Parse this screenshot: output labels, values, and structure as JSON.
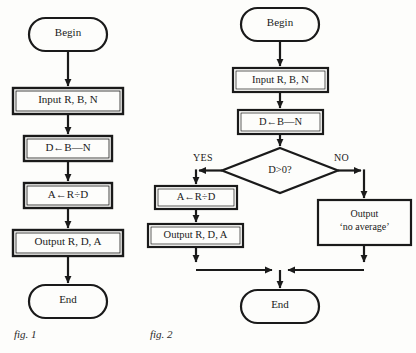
{
  "figure_set": {
    "background_color": "#fdfdfb",
    "ink_color": "#1a1a1a"
  },
  "figures": [
    {
      "caption": "fig. 1",
      "caption_x": 14,
      "caption_y": 334,
      "nodes": [
        {
          "name": "begin",
          "shape": "terminator",
          "text": "Begin",
          "x": 29,
          "y": 18,
          "w": 78,
          "h": 33,
          "font_size": 11
        },
        {
          "name": "input",
          "shape": "process",
          "text": "Input R, B, N",
          "x": 13,
          "y": 88,
          "w": 110,
          "h": 26,
          "font_size": 11
        },
        {
          "name": "compute-d",
          "shape": "process",
          "text": "D←B—N",
          "x": 24,
          "y": 136,
          "w": 88,
          "h": 25,
          "font_size": 11
        },
        {
          "name": "compute-a",
          "shape": "process",
          "text": "A←R÷D",
          "x": 24,
          "y": 183,
          "w": 88,
          "h": 25,
          "font_size": 11
        },
        {
          "name": "output",
          "shape": "process",
          "text": "Output R, D, A",
          "x": 13,
          "y": 230,
          "w": 110,
          "h": 26,
          "font_size": 11
        },
        {
          "name": "end",
          "shape": "terminator",
          "text": "End",
          "x": 29,
          "y": 285,
          "w": 78,
          "h": 33,
          "font_size": 11
        }
      ],
      "connectors": [
        {
          "name": "begin-to-input",
          "from": "begin",
          "to": "input"
        },
        {
          "name": "input-to-compute-d",
          "from": "input",
          "to": "compute-d"
        },
        {
          "name": "compute-d-to-compute-a",
          "from": "compute-d",
          "to": "compute-a"
        },
        {
          "name": "compute-a-to-output",
          "from": "compute-a",
          "to": "output"
        },
        {
          "name": "output-to-end",
          "from": "output",
          "to": "end"
        }
      ]
    },
    {
      "caption": "fig. 2",
      "caption_x": 150,
      "caption_y": 334,
      "nodes": [
        {
          "name": "begin",
          "shape": "terminator",
          "text": "Begin",
          "x": 241,
          "y": 8,
          "w": 78,
          "h": 33,
          "font_size": 11
        },
        {
          "name": "input",
          "shape": "process",
          "text": "Input R, B, N",
          "x": 233,
          "y": 68,
          "w": 95,
          "h": 24,
          "font_size": 10.5
        },
        {
          "name": "compute-d",
          "shape": "process",
          "text": "D←B—N",
          "x": 238,
          "y": 110,
          "w": 85,
          "h": 24,
          "font_size": 10.5
        },
        {
          "name": "decision",
          "shape": "decision",
          "text": "D>0?",
          "x": 222,
          "y": 148,
          "w": 116,
          "h": 45,
          "font_size": 10.5
        },
        {
          "name": "compute-a",
          "shape": "process",
          "text": "A←R÷D",
          "x": 155,
          "y": 186,
          "w": 82,
          "h": 23,
          "font_size": 10.5
        },
        {
          "name": "output-values",
          "shape": "process",
          "text": "Output R, D, A",
          "x": 148,
          "y": 224,
          "w": 95,
          "h": 23,
          "font_size": 10.5
        },
        {
          "name": "output-no-average",
          "shape": "process",
          "text": "Output\n‘no average’",
          "x": 318,
          "y": 200,
          "w": 93,
          "h": 45,
          "font_size": 10
        },
        {
          "name": "end",
          "shape": "terminator",
          "text": "End",
          "x": 241,
          "y": 290,
          "w": 78,
          "h": 33,
          "font_size": 11
        }
      ],
      "branch_labels": [
        {
          "name": "yes-label",
          "text": "YES",
          "x": 193,
          "y": 152
        },
        {
          "name": "no-label",
          "text": "NO",
          "x": 334,
          "y": 152
        }
      ],
      "connectors": [
        {
          "name": "begin-to-input",
          "from": "begin",
          "to": "input"
        },
        {
          "name": "input-to-compute-d",
          "from": "input",
          "to": "compute-d"
        },
        {
          "name": "compute-d-to-decision",
          "from": "compute-d",
          "to": "decision"
        },
        {
          "name": "decision-yes-to-compute-a",
          "from": "decision",
          "to": "compute-a",
          "label": "YES"
        },
        {
          "name": "decision-no-to-output-no-average",
          "from": "decision",
          "to": "output-no-average",
          "label": "NO"
        },
        {
          "name": "compute-a-to-output-values",
          "from": "compute-a",
          "to": "output-values"
        },
        {
          "name": "output-values-to-end",
          "from": "output-values",
          "to": "end"
        },
        {
          "name": "output-no-average-to-end",
          "from": "output-no-average",
          "to": "end"
        }
      ]
    }
  ]
}
